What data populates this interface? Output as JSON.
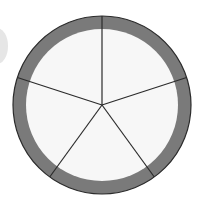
{
  "diagram": {
    "title": "",
    "shape": "circle divided into equal sectors with outer ring",
    "sector_count": 5,
    "colors": {
      "ring": "#7a7a7a",
      "sector_fill": "#f7f7f7",
      "line": "#2b2b2b",
      "background": "#ffffff",
      "side_mark": "#e6e6e6"
    }
  }
}
